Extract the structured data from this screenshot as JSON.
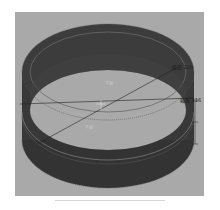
{
  "viewport": {
    "background": "#a9a9a9",
    "ring_color": "#3a3a3a",
    "ring_dark": "#2a2a2a",
    "edge_highlight": "#bdbdbd"
  },
  "annotations": {
    "section_top": "截面 220",
    "section_mid": "截面 216",
    "dim_upper": "50",
    "dim_lower": "50",
    "inner_label_top": "平面",
    "inner_label_bottom": "平面"
  }
}
